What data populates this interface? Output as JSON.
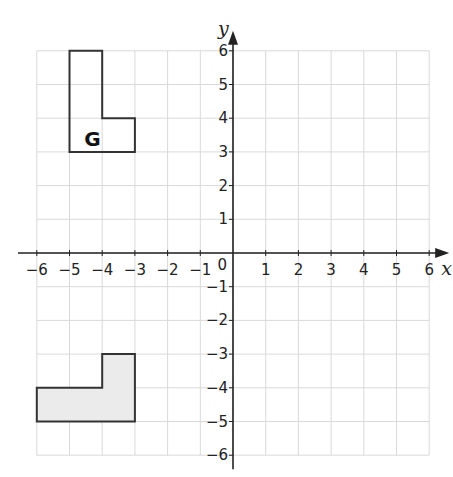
{
  "diagram": {
    "type": "coordinate-grid",
    "x_axis": {
      "label": "x",
      "min": -6,
      "max": 6,
      "ticks": [
        "-6",
        "-5",
        "-4",
        "-3",
        "-2",
        "-1",
        "1",
        "2",
        "3",
        "4",
        "5",
        "6"
      ]
    },
    "y_axis": {
      "label": "y",
      "min": -6,
      "max": 6,
      "ticks": [
        "6",
        "5",
        "4",
        "3",
        "2",
        "1",
        "-1",
        "-2",
        "-3",
        "-4",
        "-5",
        "-6"
      ]
    },
    "origin_label": "0",
    "shapes": [
      {
        "name": "G",
        "label": "G",
        "fill": "none",
        "vertices": [
          [
            -5,
            6
          ],
          [
            -4,
            6
          ],
          [
            -4,
            4
          ],
          [
            -3,
            4
          ],
          [
            -3,
            3
          ],
          [
            -5,
            3
          ]
        ]
      },
      {
        "name": "image",
        "label": "",
        "fill": "#ebebeb",
        "vertices": [
          [
            -6,
            -4
          ],
          [
            -4,
            -4
          ],
          [
            -4,
            -3
          ],
          [
            -3,
            -3
          ],
          [
            -3,
            -5
          ],
          [
            -6,
            -5
          ]
        ]
      }
    ],
    "colors": {
      "grid": "#d9d9d9",
      "axis": "#222222",
      "outline": "#333333",
      "shade": "#ebebeb"
    }
  }
}
